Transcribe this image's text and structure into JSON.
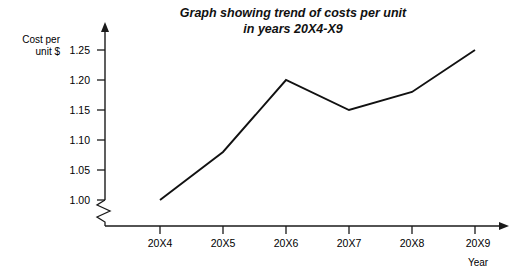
{
  "chart_data": {
    "type": "line",
    "title": "Graph showing trend of costs per unit in years 20X4-X9",
    "title_lines": [
      "Graph showing trend of costs per unit",
      "in years 20X4-X9"
    ],
    "categories": [
      "20X4",
      "20X5",
      "20X6",
      "20X7",
      "20X8",
      "20X9"
    ],
    "values": [
      1.0,
      1.08,
      1.2,
      1.15,
      1.18,
      1.25
    ],
    "series": [
      {
        "name": "Cost per unit $",
        "values": [
          1.0,
          1.08,
          1.2,
          1.15,
          1.18,
          1.25
        ]
      }
    ],
    "xlabel": "Year",
    "ylabel": "Cost per unit $",
    "ylabel_lines": [
      "Cost per",
      "unit $"
    ],
    "ytick_labels": [
      "1.00",
      "1.05",
      "1.10",
      "1.15",
      "1.20",
      "1.25"
    ],
    "ytick_values": [
      1.0,
      1.05,
      1.1,
      1.15,
      1.2,
      1.25
    ],
    "ylim": [
      1.0,
      1.25
    ],
    "y_axis_break": true,
    "grid": false,
    "legend": false,
    "line_color": "#111111",
    "axis_color": "#1a1a1a",
    "background": "#ffffff"
  }
}
